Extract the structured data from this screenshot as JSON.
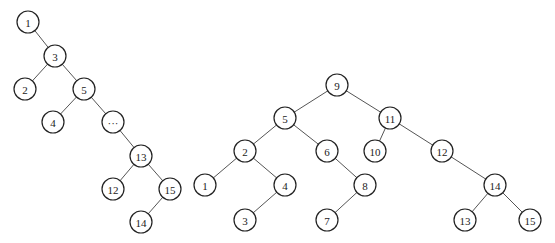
{
  "diagram": {
    "type": "binary-trees",
    "node_radius": 11,
    "colors": {
      "stroke": "#222222",
      "edge": "#555555",
      "fill": "#ffffff"
    },
    "trees": [
      {
        "name": "left-tree",
        "nodes": [
          {
            "id": "L1",
            "label": "1",
            "x": 28,
            "y": 22
          },
          {
            "id": "L3",
            "label": "3",
            "x": 55,
            "y": 56
          },
          {
            "id": "L2",
            "label": "2",
            "x": 25,
            "y": 89
          },
          {
            "id": "L5",
            "label": "5",
            "x": 84,
            "y": 89
          },
          {
            "id": "L4",
            "label": "4",
            "x": 53,
            "y": 122
          },
          {
            "id": "Ldots",
            "label": "···",
            "x": 113,
            "y": 122
          },
          {
            "id": "L13",
            "label": "13",
            "x": 141,
            "y": 156
          },
          {
            "id": "L12",
            "label": "12",
            "x": 113,
            "y": 189
          },
          {
            "id": "L15",
            "label": "15",
            "x": 170,
            "y": 189
          },
          {
            "id": "L14",
            "label": "14",
            "x": 141,
            "y": 222
          }
        ],
        "edges": [
          [
            "L1",
            "L3"
          ],
          [
            "L3",
            "L2"
          ],
          [
            "L3",
            "L5"
          ],
          [
            "L5",
            "L4"
          ],
          [
            "L5",
            "Ldots"
          ],
          [
            "Ldots",
            "L13"
          ],
          [
            "L13",
            "L12"
          ],
          [
            "L13",
            "L15"
          ],
          [
            "L15",
            "L14"
          ]
        ]
      },
      {
        "name": "right-tree",
        "nodes": [
          {
            "id": "R9",
            "label": "9",
            "x": 337,
            "y": 85
          },
          {
            "id": "R5",
            "label": "5",
            "x": 285,
            "y": 118
          },
          {
            "id": "R11",
            "label": "11",
            "x": 390,
            "y": 118
          },
          {
            "id": "R2",
            "label": "2",
            "x": 245,
            "y": 151
          },
          {
            "id": "R6",
            "label": "6",
            "x": 327,
            "y": 151
          },
          {
            "id": "R10",
            "label": "10",
            "x": 375,
            "y": 151
          },
          {
            "id": "R12",
            "label": "12",
            "x": 442,
            "y": 151
          },
          {
            "id": "R1",
            "label": "1",
            "x": 205,
            "y": 185
          },
          {
            "id": "R4",
            "label": "4",
            "x": 285,
            "y": 185
          },
          {
            "id": "R8",
            "label": "8",
            "x": 365,
            "y": 185
          },
          {
            "id": "R14",
            "label": "14",
            "x": 495,
            "y": 185
          },
          {
            "id": "R3",
            "label": "3",
            "x": 245,
            "y": 220
          },
          {
            "id": "R7",
            "label": "7",
            "x": 327,
            "y": 220
          },
          {
            "id": "R13",
            "label": "13",
            "x": 465,
            "y": 220
          },
          {
            "id": "R15",
            "label": "15",
            "x": 530,
            "y": 220
          }
        ],
        "edges": [
          [
            "R9",
            "R5"
          ],
          [
            "R9",
            "R11"
          ],
          [
            "R5",
            "R2"
          ],
          [
            "R5",
            "R6"
          ],
          [
            "R11",
            "R10"
          ],
          [
            "R11",
            "R12"
          ],
          [
            "R2",
            "R1"
          ],
          [
            "R2",
            "R4"
          ],
          [
            "R6",
            "R8"
          ],
          [
            "R12",
            "R14"
          ],
          [
            "R4",
            "R3"
          ],
          [
            "R8",
            "R7"
          ],
          [
            "R14",
            "R13"
          ],
          [
            "R14",
            "R15"
          ]
        ]
      }
    ]
  }
}
